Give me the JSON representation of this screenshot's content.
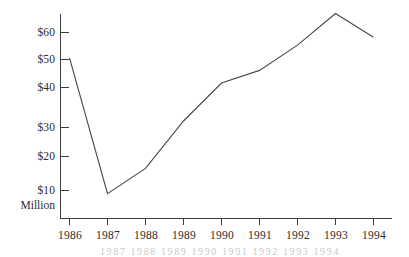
{
  "chart_data": {
    "type": "line",
    "title": "",
    "subtitle": "",
    "xlabel": "",
    "ylabel": "$ Million",
    "unit_note": "Million",
    "categories": [
      "1986",
      "1987",
      "1988",
      "1989",
      "1990",
      "1991",
      "1992",
      "1993",
      "1994"
    ],
    "values": [
      52,
      9,
      17,
      32,
      44,
      48,
      56,
      66,
      58.5
    ],
    "series": [
      {
        "name": "",
        "values": [
          52,
          9,
          17,
          32,
          44,
          48,
          56,
          66,
          58.5
        ]
      }
    ],
    "xlim": [
      1986,
      1994
    ],
    "ylim": [
      0,
      70
    ],
    "ytick_labels": [
      "$60",
      "$50",
      "$40",
      "$30",
      "$20",
      "$10"
    ],
    "ytick_values": [
      60,
      50,
      40,
      30,
      20,
      10
    ],
    "xtick_labels": [
      "1986",
      "1987",
      "1988",
      "1989",
      "1990",
      "1991",
      "1992",
      "1993",
      "1994"
    ],
    "grid": false,
    "legend": false,
    "legend_position": "none",
    "annotations": [],
    "colors": {
      "line": "#4a4a4a",
      "axis": "#3d3d3d",
      "background": "#ffffff",
      "text": "#2b2b2b"
    }
  },
  "axes": {
    "y_unit_label": "Million"
  },
  "page": {
    "bleed_text": "1987   1988   1989   1990   1991   1992   1993   1994"
  }
}
